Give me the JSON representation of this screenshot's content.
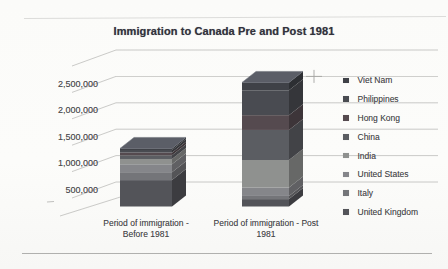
{
  "window": {
    "width": 448,
    "height": 269,
    "background": "#fcfcfa"
  },
  "document": {
    "top_rule_color": "#dcdcda",
    "bottom_rule_color": "#b0b0ae"
  },
  "chart": {
    "title": "Immigration to Canada Pre and Post 1981",
    "style": {
      "title_color": "#32323c",
      "axis_text_color": "#4d4d50",
      "legend_text_color": "#48484b",
      "grid_color": "#b7b7b5",
      "artifact_color": "#a4a4a2"
    },
    "y_axis": {
      "tick_labels": [
        "2,500,000",
        "2,000,000",
        "1,500,000",
        "1,000,000",
        "500,000"
      ]
    },
    "x_axis": {
      "category_lines": [
        [
          "Period of immigration -",
          "Before 1981"
        ],
        [
          "Period of immigration - Post",
          "1981"
        ]
      ]
    },
    "legend": {
      "position": "right",
      "items": [
        {
          "label": "Viet Nam",
          "color": "#3f4147"
        },
        {
          "label": "Philippines",
          "color": "#494b51"
        },
        {
          "label": "Hong Kong",
          "color": "#554a4f"
        },
        {
          "label": "China",
          "color": "#5b5d62"
        },
        {
          "label": "India",
          "color": "#8f918f"
        },
        {
          "label": "United States",
          "color": "#85868a"
        },
        {
          "label": "Italy",
          "color": "#747579"
        },
        {
          "label": "United Kingdom",
          "color": "#535459"
        }
      ]
    }
  },
  "chart_data": {
    "type": "bar",
    "subtype": "3d-stacked-column",
    "title": "Immigration to Canada Pre and Post 1981",
    "categories": [
      "Period of immigration - Before 1981",
      "Period of immigration - Post 1981"
    ],
    "series": [
      {
        "name": "Viet Nam",
        "values": [
          30000,
          150000
        ],
        "color": "#3f4147"
      },
      {
        "name": "Philippines",
        "values": [
          50000,
          470000
        ],
        "color": "#494b51"
      },
      {
        "name": "Hong Kong",
        "values": [
          50000,
          280000
        ],
        "color": "#554a4f"
      },
      {
        "name": "China",
        "values": [
          70000,
          570000
        ],
        "color": "#5b5d62"
      },
      {
        "name": "India",
        "values": [
          100000,
          520000
        ],
        "color": "#8f918f"
      },
      {
        "name": "United States",
        "values": [
          150000,
          160000
        ],
        "color": "#85868a"
      },
      {
        "name": "Italy",
        "values": [
          150000,
          60000
        ],
        "color": "#747579"
      },
      {
        "name": "United Kingdom",
        "values": [
          500000,
          140000
        ],
        "color": "#535459"
      }
    ],
    "stack_order": "last-series-at-bottom",
    "category_totals_estimated": [
      1100000,
      2350000
    ],
    "ylim": [
      0,
      3000000
    ],
    "ytick_interval": 500000,
    "grid": true,
    "legend_position": "right",
    "values_estimated_from_gridlines": true
  }
}
